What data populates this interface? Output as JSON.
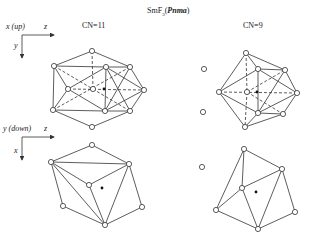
{
  "title": {
    "compound": "SmF",
    "subscript": "3",
    "space_group": "Pnma"
  },
  "panels": {
    "cn11_label": "CN=11",
    "cn9_label": "CN=9"
  },
  "axes": {
    "top": {
      "corner_label": "x (up)",
      "horizontal": "z",
      "vertical": "y"
    },
    "bottom": {
      "corner_label": "y (down)",
      "horizontal": "z",
      "vertical": "x"
    }
  },
  "colors": {
    "line": "#333333",
    "background": "#ffffff"
  }
}
